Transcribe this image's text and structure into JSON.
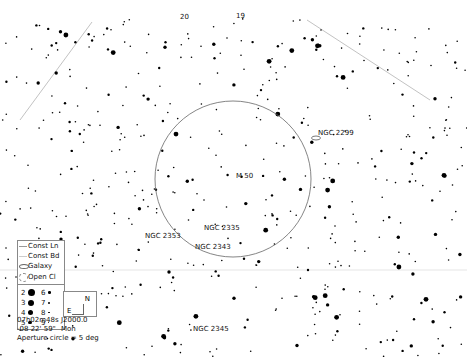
{
  "chart": {
    "background": "#ffffff",
    "star_color": "#000000",
    "line_color": "#bbbbbb",
    "circle_color": "#666666",
    "aperture_circle": {
      "cx": 233,
      "cy": 179,
      "r": 78
    },
    "const_lines": [
      {
        "x1": 20,
        "y1": 120,
        "x2": 92,
        "y2": 22
      },
      {
        "x1": 307,
        "y1": 20,
        "x2": 430,
        "y2": 100
      }
    ],
    "boundary_lines": [
      {
        "x1": 0,
        "y1": 270,
        "x2": 467,
        "y2": 270
      }
    ]
  },
  "labels": {
    "star_20": {
      "text": "20",
      "x": 180,
      "y": 13
    },
    "star_19": {
      "text": "19",
      "x": 236,
      "y": 12
    },
    "m50": {
      "text": "M 50",
      "x": 236,
      "y": 172
    },
    "ngc2299": {
      "text": "NGC 2299",
      "x": 318,
      "y": 129
    },
    "ngc2335": {
      "text": "NGC 2335",
      "x": 204,
      "y": 224
    },
    "ngc2353": {
      "text": "NGC 2353",
      "x": 145,
      "y": 232
    },
    "ngc2343": {
      "text": "NGC 2343",
      "x": 195,
      "y": 243
    },
    "ngc2345": {
      "text": "NGC 2345",
      "x": 193,
      "y": 325
    }
  },
  "deep_sky": [
    {
      "type": "galaxy",
      "name": "NGC 2299",
      "x": 316,
      "y": 138
    },
    {
      "type": "open_cluster",
      "name": "M 50",
      "x": 233,
      "y": 176
    },
    {
      "type": "open_cluster",
      "name": "NGC 2335",
      "x": 200,
      "y": 228
    },
    {
      "type": "open_cluster",
      "name": "NGC 2353",
      "x": 186,
      "y": 238
    },
    {
      "type": "open_cluster",
      "name": "NGC 2343",
      "x": 193,
      "y": 248
    },
    {
      "type": "open_cluster",
      "name": "NGC 2345",
      "x": 190,
      "y": 329
    }
  ],
  "legend": {
    "const_line": "Const Ln",
    "const_boundary": "Const Bd",
    "galaxy": "Galaxy",
    "open_cluster": "Open Cl",
    "magnitudes": [
      {
        "mag": "2",
        "size": 7
      },
      {
        "mag": "6",
        "size": 2.5
      },
      {
        "mag": "3",
        "size": 6
      },
      {
        "mag": "7",
        "size": 2
      },
      {
        "mag": "4",
        "size": 5
      },
      {
        "mag": "8",
        "size": 1.5
      },
      {
        "mag": "5",
        "size": 3.5
      },
      {
        "mag": "9",
        "size": 1
      }
    ]
  },
  "orientation": {
    "north": "N",
    "east": "E"
  },
  "info": {
    "ra": "07h02m48s",
    "epoch": "J2000.0",
    "dec": "-08 22' 59\"",
    "constellation": "Mon",
    "aperture": "Aperture circle = 5 deg"
  },
  "starfield": {
    "seed": 50,
    "count": 520,
    "width": 467,
    "height": 357,
    "top_margin": 18
  }
}
